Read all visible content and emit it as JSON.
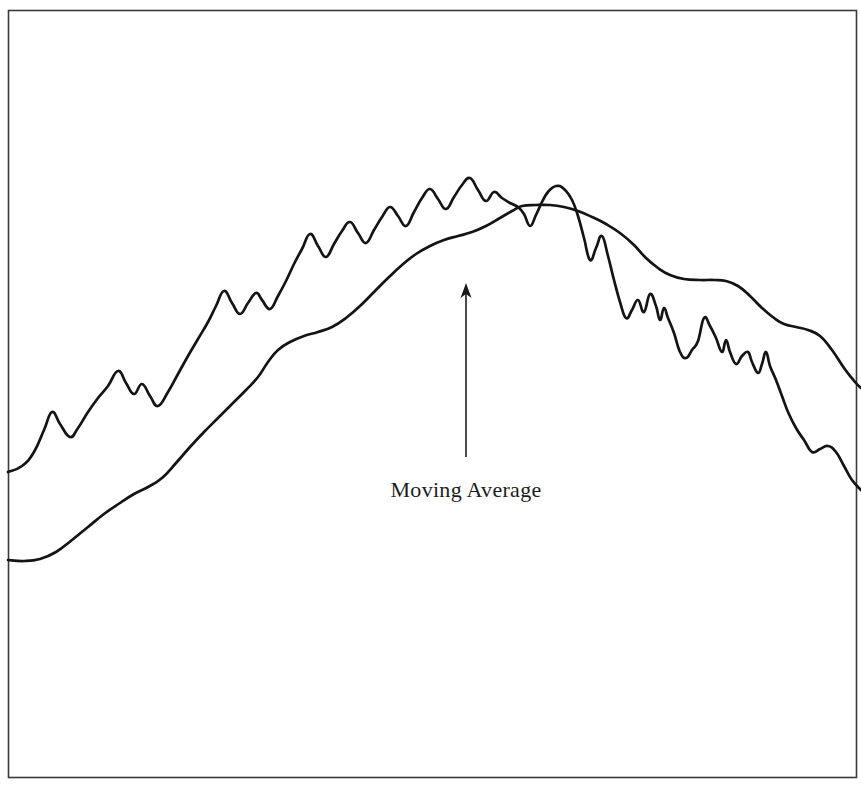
{
  "figure": {
    "width": 861,
    "height": 788,
    "background_color": "#ffffff",
    "border_color": "#3a3a3a",
    "line_color": "#141414"
  },
  "annotation": {
    "label": "Moving Average",
    "label_x": 466,
    "label_y": 497,
    "arrow_tip_x": 466,
    "arrow_tip_y": 283,
    "arrow_tail_x": 466,
    "arrow_tail_y": 457,
    "arrow_color": "#1a1a1a"
  },
  "chart_data": {
    "type": "line",
    "title": "",
    "subtitle": "",
    "xlabel": "",
    "ylabel": "",
    "grid": false,
    "legend": "none",
    "axis_ticks": "none",
    "annotations": [
      {
        "text": "Moving Average",
        "points_to": "smooth-lower-curve",
        "arrow": "up"
      }
    ],
    "xlim": [
      8,
      861
    ],
    "ylim": [
      778,
      10
    ],
    "series": [
      {
        "name": "Price",
        "style": "jagged",
        "points": [
          [
            8,
            472
          ],
          [
            22,
            466
          ],
          [
            34,
            452
          ],
          [
            44,
            430
          ],
          [
            52,
            412
          ],
          [
            60,
            424
          ],
          [
            70,
            437
          ],
          [
            78,
            428
          ],
          [
            88,
            412
          ],
          [
            98,
            398
          ],
          [
            108,
            386
          ],
          [
            118,
            371
          ],
          [
            126,
            383
          ],
          [
            134,
            394
          ],
          [
            142,
            384
          ],
          [
            150,
            396
          ],
          [
            158,
            406
          ],
          [
            168,
            392
          ],
          [
            178,
            374
          ],
          [
            188,
            356
          ],
          [
            198,
            339
          ],
          [
            208,
            322
          ],
          [
            216,
            306
          ],
          [
            224,
            291
          ],
          [
            232,
            303
          ],
          [
            240,
            314
          ],
          [
            248,
            303
          ],
          [
            256,
            293
          ],
          [
            262,
            300
          ],
          [
            270,
            309
          ],
          [
            278,
            296
          ],
          [
            286,
            281
          ],
          [
            294,
            264
          ],
          [
            302,
            249
          ],
          [
            310,
            234
          ],
          [
            318,
            246
          ],
          [
            326,
            257
          ],
          [
            334,
            244
          ],
          [
            342,
            231
          ],
          [
            350,
            222
          ],
          [
            358,
            233
          ],
          [
            366,
            243
          ],
          [
            374,
            230
          ],
          [
            382,
            217
          ],
          [
            390,
            207
          ],
          [
            398,
            216
          ],
          [
            406,
            226
          ],
          [
            414,
            212
          ],
          [
            422,
            198
          ],
          [
            430,
            189
          ],
          [
            438,
            199
          ],
          [
            446,
            209
          ],
          [
            454,
            197
          ],
          [
            462,
            185
          ],
          [
            470,
            178
          ],
          [
            478,
            190
          ],
          [
            486,
            201
          ],
          [
            494,
            192
          ],
          [
            502,
            198
          ],
          [
            510,
            203
          ],
          [
            518,
            207
          ],
          [
            524,
            214
          ],
          [
            530,
            226
          ],
          [
            536,
            215
          ],
          [
            542,
            202
          ],
          [
            548,
            192
          ],
          [
            556,
            186
          ],
          [
            564,
            189
          ],
          [
            572,
            200
          ],
          [
            578,
            216
          ],
          [
            584,
            238
          ],
          [
            590,
            260
          ],
          [
            596,
            248
          ],
          [
            602,
            236
          ],
          [
            608,
            256
          ],
          [
            614,
            280
          ],
          [
            620,
            302
          ],
          [
            626,
            318
          ],
          [
            632,
            310
          ],
          [
            638,
            300
          ],
          [
            644,
            312
          ],
          [
            650,
            294
          ],
          [
            656,
            306
          ],
          [
            660,
            320
          ],
          [
            664,
            308
          ],
          [
            668,
            318
          ],
          [
            674,
            333
          ],
          [
            680,
            352
          ],
          [
            686,
            358
          ],
          [
            692,
            350
          ],
          [
            698,
            341
          ],
          [
            704,
            318
          ],
          [
            710,
            326
          ],
          [
            716,
            338
          ],
          [
            722,
            352
          ],
          [
            726,
            340
          ],
          [
            730,
            352
          ],
          [
            736,
            364
          ],
          [
            742,
            356
          ],
          [
            748,
            352
          ],
          [
            752,
            362
          ],
          [
            758,
            373
          ],
          [
            762,
            364
          ],
          [
            766,
            352
          ],
          [
            770,
            366
          ],
          [
            776,
            380
          ],
          [
            782,
            396
          ],
          [
            788,
            412
          ],
          [
            796,
            428
          ],
          [
            804,
            440
          ],
          [
            812,
            452
          ],
          [
            820,
            449
          ],
          [
            828,
            446
          ],
          [
            836,
            452
          ],
          [
            844,
            466
          ],
          [
            852,
            480
          ],
          [
            861,
            490
          ]
        ]
      },
      {
        "name": "Moving Average",
        "style": "smooth",
        "points": [
          [
            8,
            560
          ],
          [
            24,
            561
          ],
          [
            40,
            559
          ],
          [
            56,
            552
          ],
          [
            72,
            540
          ],
          [
            88,
            527
          ],
          [
            104,
            514
          ],
          [
            120,
            503
          ],
          [
            134,
            494
          ],
          [
            148,
            487
          ],
          [
            162,
            478
          ],
          [
            176,
            463
          ],
          [
            190,
            447
          ],
          [
            204,
            432
          ],
          [
            218,
            418
          ],
          [
            232,
            404
          ],
          [
            246,
            390
          ],
          [
            258,
            377
          ],
          [
            268,
            362
          ],
          [
            278,
            350
          ],
          [
            290,
            342
          ],
          [
            304,
            336
          ],
          [
            318,
            332
          ],
          [
            332,
            327
          ],
          [
            346,
            318
          ],
          [
            360,
            306
          ],
          [
            374,
            292
          ],
          [
            388,
            278
          ],
          [
            402,
            265
          ],
          [
            416,
            254
          ],
          [
            430,
            246
          ],
          [
            444,
            240
          ],
          [
            458,
            236
          ],
          [
            472,
            232
          ],
          [
            486,
            226
          ],
          [
            500,
            218
          ],
          [
            512,
            211
          ],
          [
            522,
            206
          ],
          [
            536,
            205
          ],
          [
            550,
            205
          ],
          [
            564,
            207
          ],
          [
            578,
            211
          ],
          [
            592,
            217
          ],
          [
            606,
            224
          ],
          [
            620,
            233
          ],
          [
            634,
            245
          ],
          [
            646,
            258
          ],
          [
            658,
            268
          ],
          [
            670,
            275
          ],
          [
            684,
            279
          ],
          [
            700,
            280
          ],
          [
            714,
            280
          ],
          [
            726,
            281
          ],
          [
            738,
            286
          ],
          [
            750,
            296
          ],
          [
            762,
            308
          ],
          [
            774,
            318
          ],
          [
            784,
            324
          ],
          [
            796,
            327
          ],
          [
            808,
            330
          ],
          [
            820,
            336
          ],
          [
            832,
            350
          ],
          [
            844,
            368
          ],
          [
            855,
            382
          ],
          [
            861,
            388
          ]
        ]
      }
    ]
  }
}
